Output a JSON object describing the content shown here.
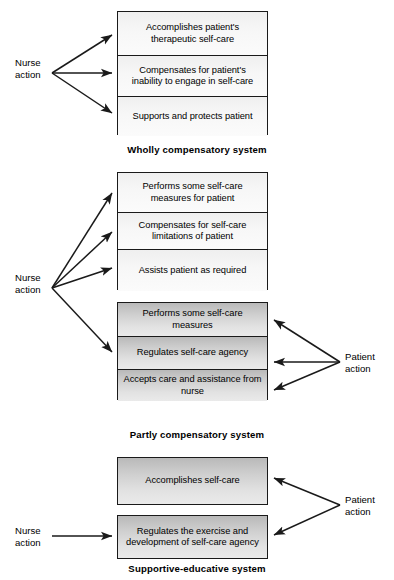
{
  "diagram": {
    "actor_labels": {
      "nurse": "Nurse\naction",
      "nurse_line1": "Nurse",
      "nurse_line2": "action",
      "patient_line1": "Patient",
      "patient_line2": "action"
    },
    "colors": {
      "stroke": "#1a1a1a",
      "nurse_cell_fill": "#f7f7f7",
      "patient_cell_fill": "#cfcfcf",
      "text": "#000000",
      "background": "#ffffff"
    },
    "systems": [
      {
        "id": "wholly-compensatory",
        "caption": "Wholly compensatory system",
        "blocks": [
          {
            "actor": "nurse",
            "shading": "light",
            "cells": [
              "Accomplishes patient's therapeutic self-care",
              "Compensates for patient's inability to engage in self-care",
              "Supports and protects patient"
            ]
          }
        ]
      },
      {
        "id": "partly-compensatory",
        "caption": "Partly compensatory system",
        "blocks": [
          {
            "actor": "nurse",
            "shading": "light",
            "cells": [
              "Performs some self-care measures for patient",
              "Compensates for self-care limitations of patient",
              "Assists patient as required"
            ]
          },
          {
            "actor": "patient",
            "shading": "shaded",
            "cells": [
              "Performs some self-care measures",
              "Regulates self-care agency",
              "Accepts care and assistance from nurse"
            ]
          }
        ]
      },
      {
        "id": "supportive-educative",
        "caption": "Supportive-educative system",
        "blocks": [
          {
            "actor": "patient",
            "shading": "shaded",
            "cells": [
              "Accomplishes self-care"
            ]
          },
          {
            "actor": "both",
            "shading": "shaded",
            "cells": [
              "Regulates the exercise and development of self-care agency"
            ]
          }
        ]
      }
    ],
    "cells_flat": {
      "g1c1": "Accomplishes patient's therapeutic self-care",
      "g1c2": "Compensates for patient's inability to engage in self-care",
      "g1c3": "Supports and protects patient",
      "g2c1": "Performs some self-care measures for patient",
      "g2c2": "Compensates for self-care limitations of patient",
      "g2c3": "Assists patient as required",
      "g3c1": "Performs some self-care measures",
      "g3c2": "Regulates self-care agency",
      "g3c3": "Accepts care and assistance from nurse",
      "g4c1": "Accomplishes self-care",
      "g5c1": "Regulates the exercise and development of self-care agency"
    },
    "captions": {
      "c1": "Wholly compensatory system",
      "c2": "Partly compensatory system",
      "c3": "Supportive-educative system"
    }
  }
}
